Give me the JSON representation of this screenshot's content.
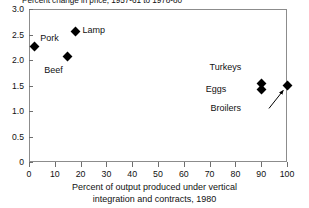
{
  "chart_data": {
    "type": "scatter",
    "title": "Percent change in price, 1957-61 to 1978-80",
    "xlabel_line1": "Percent of output produced under vertical",
    "xlabel_line2": "integration and contracts, 1980",
    "ylabel": "",
    "xlim": [
      0,
      100
    ],
    "ylim": [
      0,
      3.0
    ],
    "xticks": [
      "0",
      "10",
      "20",
      "30",
      "40",
      "50",
      "60",
      "70",
      "80",
      "90",
      "100"
    ],
    "xtick_values": [
      0,
      10,
      20,
      30,
      40,
      50,
      60,
      70,
      80,
      90,
      100
    ],
    "yticks": [
      "0",
      "0.5",
      "1.0",
      "1.5",
      "2.0",
      "2.5",
      "3.0"
    ],
    "ytick_values": [
      0,
      0.5,
      1.0,
      1.5,
      2.0,
      2.5,
      3.0
    ],
    "grid": false,
    "legend": "none",
    "marker_shape": "diamond",
    "marker_color": "#000000",
    "frame_color": "#8c8c8c",
    "points": [
      {
        "label": "Pork",
        "x": 2,
        "y": 2.26,
        "label_dx": 6,
        "label_dy": -14
      },
      {
        "label": "Lamp",
        "x": 18,
        "y": 2.56,
        "label_dx": 7,
        "label_dy": -6
      },
      {
        "label": "Beef",
        "x": 15,
        "y": 2.06,
        "label_dx": -5,
        "label_dy": 8
      },
      {
        "label": "Turkeys",
        "x": 90,
        "y": 1.53,
        "label_dx": -20,
        "label_dy": -22
      },
      {
        "label": "Eggs",
        "x": 90,
        "y": 1.42,
        "label_dx": -35,
        "label_dy": -6
      },
      {
        "label": "Broilers",
        "x": 100,
        "y": 1.5,
        "label_dx": -46,
        "label_dy": 17
      }
    ],
    "annotations": [
      {
        "name": "broilers-leader-arrow",
        "from_x": 93,
        "from_y": 1.05,
        "to_x": 98.5,
        "to_y": 1.4
      }
    ]
  }
}
